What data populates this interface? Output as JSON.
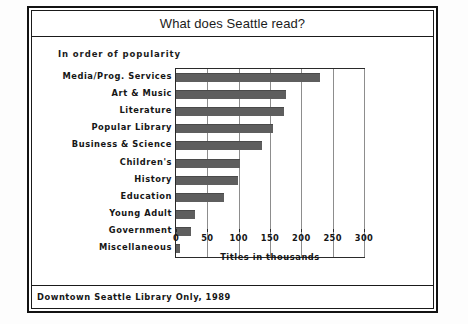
{
  "chart_data": {
    "type": "bar",
    "orientation": "horizontal",
    "title": "What does Seattle read?",
    "subtitle": "In order of popularity",
    "xlabel": "Titles in thousands",
    "ylabel": "",
    "footnote": "Downtown Seattle Library Only, 1989",
    "categories": [
      "Media/Prog. Services",
      "Art & Music",
      "Literature",
      "Popular Library",
      "Business & Science",
      "Children's",
      "History",
      "Education",
      "Young Adult",
      "Government",
      "Miscellaneous"
    ],
    "values": [
      230,
      175,
      172,
      155,
      137,
      102,
      99,
      77,
      31,
      24,
      6
    ],
    "xlim": [
      0,
      300
    ],
    "xticks": [
      0,
      50,
      100,
      150,
      200,
      250,
      300
    ],
    "xtick_labels": [
      "0",
      "50",
      "100",
      "150",
      "200",
      "250",
      "300"
    ],
    "grid": true,
    "grid_axis": "x",
    "legend": false,
    "bar_color": "#5e5e5e",
    "frame_color": "#1a1a1a",
    "gridline_color": "#8d8d8d"
  }
}
